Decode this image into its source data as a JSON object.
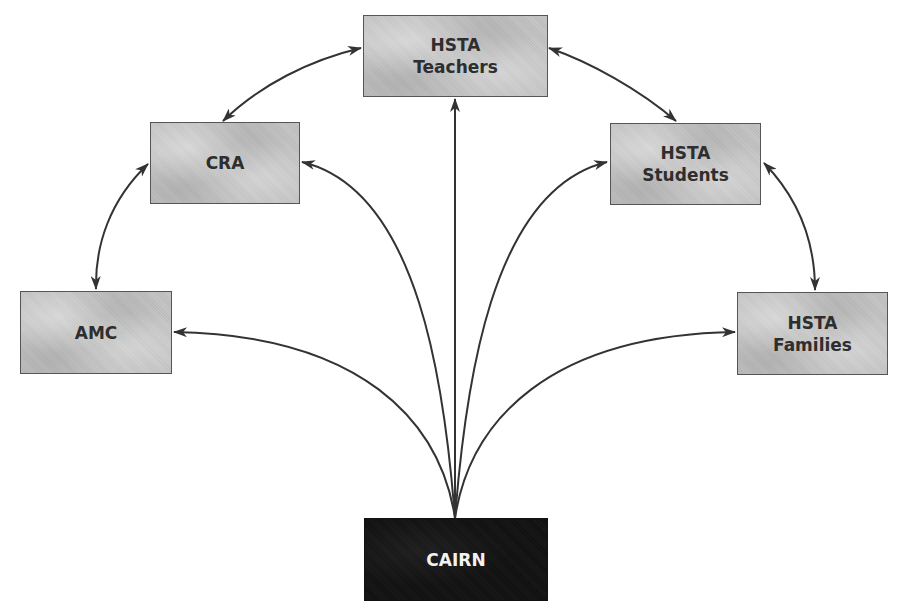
{
  "diagram": {
    "colors": {
      "node_fill": "#c4c4c4",
      "node_border": "#555555",
      "node_text": "#2e2e2e",
      "hub_fill": "#111111",
      "hub_text": "#f2f2f2",
      "arrow": "#333333",
      "background": "#ffffff"
    },
    "nodes": {
      "teachers": {
        "line1": "HSTA",
        "line2": "Teachers"
      },
      "cra": {
        "line1": "CRA"
      },
      "students": {
        "line1": "HSTA",
        "line2": "Students"
      },
      "amc": {
        "line1": "AMC"
      },
      "families": {
        "line1": "HSTA",
        "line2": "Families"
      },
      "cairn": {
        "line1": "CAIRN"
      }
    },
    "edges": [
      {
        "from": "CAIRN",
        "to": "AMC",
        "direction": "one-way"
      },
      {
        "from": "CAIRN",
        "to": "CRA",
        "direction": "one-way"
      },
      {
        "from": "CAIRN",
        "to": "HSTA Teachers",
        "direction": "one-way"
      },
      {
        "from": "CAIRN",
        "to": "HSTA Students",
        "direction": "one-way"
      },
      {
        "from": "CAIRN",
        "to": "HSTA Families",
        "direction": "one-way"
      },
      {
        "from": "CRA",
        "to": "HSTA Teachers",
        "direction": "two-way"
      },
      {
        "from": "HSTA Teachers",
        "to": "HSTA Students",
        "direction": "two-way"
      },
      {
        "from": "CRA",
        "to": "AMC",
        "direction": "two-way"
      },
      {
        "from": "HSTA Students",
        "to": "HSTA Families",
        "direction": "two-way"
      }
    ]
  }
}
